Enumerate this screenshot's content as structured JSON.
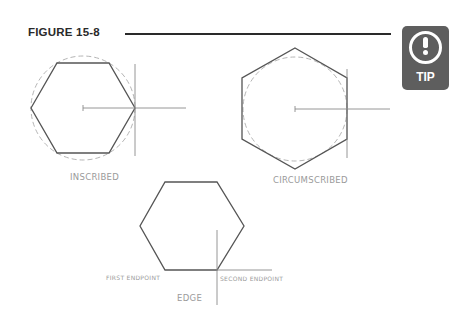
{
  "figure": {
    "title": "FIGURE 15-8"
  },
  "tip_badge": {
    "icon": "exclamation-circle-icon",
    "label": "TIP",
    "color": "#5e5e5e"
  },
  "diagrams": [
    {
      "id": "inscribed",
      "label": "INSCRIBED",
      "description": "Hexagon inscribed in a dashed circle; radius line from center to a vertex"
    },
    {
      "id": "circumscribed",
      "label": "CIRCUMSCRIBED",
      "description": "Hexagon circumscribed about a dashed circle; radius line from center to midpoint of a side"
    },
    {
      "id": "edge",
      "label": "EDGE",
      "first_endpoint_label": "FIRST ENDPOINT",
      "second_endpoint_label": "SECOND ENDPOINT",
      "description": "Hexagon defined by the endpoints of one edge"
    }
  ],
  "colors": {
    "line": "#555555",
    "construction": "#8a8a8a",
    "dashed_circle": "#b5b5b5",
    "label_text": "#9a9a9a"
  }
}
